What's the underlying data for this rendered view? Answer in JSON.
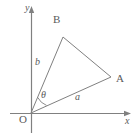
{
  "figure": {
    "type": "geometry-diagram",
    "colors": {
      "stroke": "#808080",
      "label": "#5a5a5a",
      "background": "#ffffff"
    },
    "axes": {
      "x_axis": {
        "label": "x",
        "start": [
          10,
          113
        ],
        "end": [
          130,
          113
        ],
        "arrow": "right"
      },
      "y_axis": {
        "label": "y",
        "start": [
          31,
          133
        ],
        "end": [
          31,
          7
        ],
        "arrow": "up"
      },
      "origin_label": "O",
      "origin": [
        31,
        113
      ]
    },
    "points": [
      {
        "name": "O",
        "label": "O",
        "x": 31,
        "y": 113
      },
      {
        "name": "A",
        "label": "A",
        "x": 111,
        "y": 77
      },
      {
        "name": "B",
        "label": "B",
        "x": 63,
        "y": 37
      }
    ],
    "segments": [
      {
        "name": "OB",
        "label": "b",
        "from": "O",
        "to": "B"
      },
      {
        "name": "OA",
        "label": "a",
        "from": "O",
        "to": "A"
      },
      {
        "name": "BA",
        "label": "",
        "from": "B",
        "to": "A"
      }
    ],
    "angle": {
      "name": "theta",
      "label": "θ",
      "vertex": "O",
      "between": [
        "OB",
        "OA"
      ],
      "arc_radius": 17
    }
  }
}
